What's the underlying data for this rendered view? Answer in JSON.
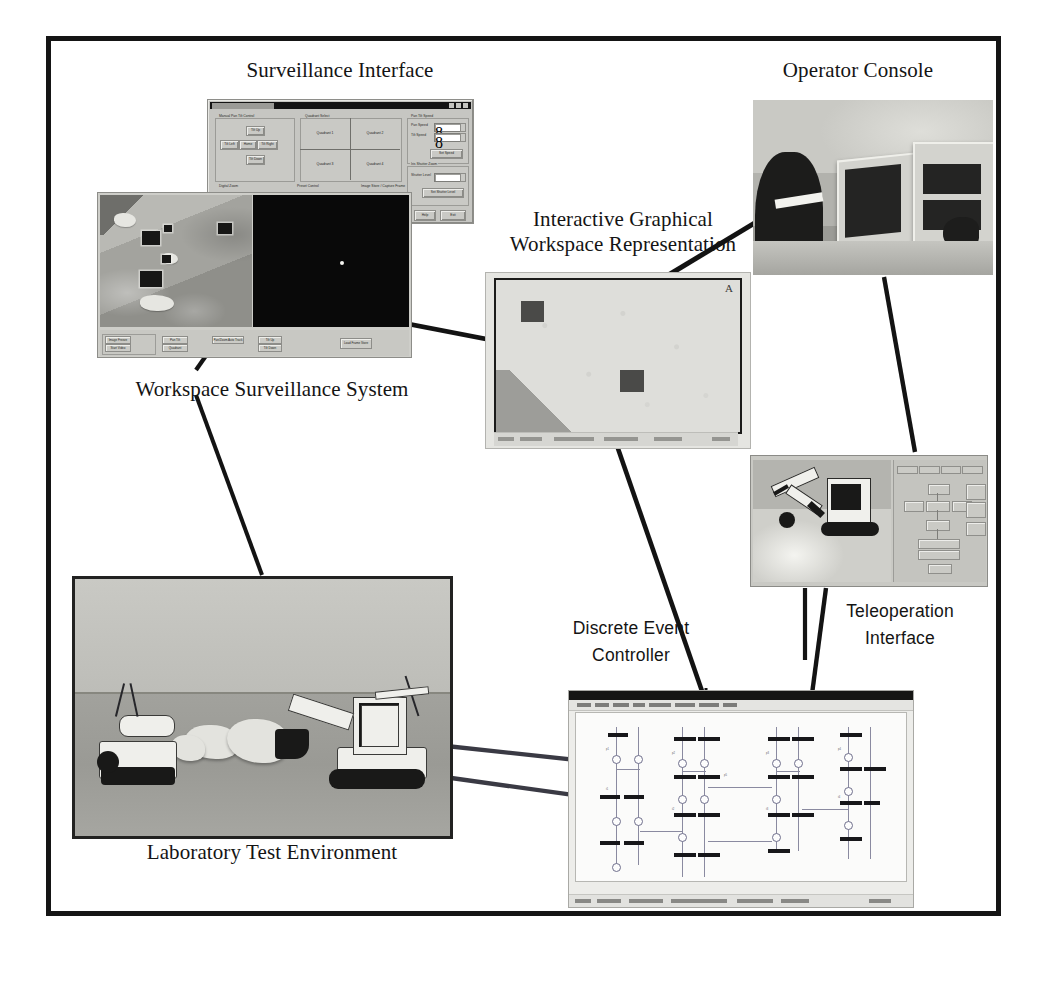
{
  "figure": {
    "frame_color": "#151515",
    "background_color": "#ffffff"
  },
  "labels": [
    {
      "id": "surveillance-interface",
      "text": "Surveillance Interface",
      "style": "serif"
    },
    {
      "id": "operator-console",
      "text": "Operator Console",
      "style": "serif"
    },
    {
      "id": "interactive-graphical",
      "text": "Interactive Graphical\nWorkspace Representation",
      "style": "serif"
    },
    {
      "id": "workspace-surveillance",
      "text": "Workspace Surveillance System",
      "style": "serif"
    },
    {
      "id": "laboratory-test",
      "text": "Laboratory Test Environment",
      "style": "serif"
    },
    {
      "id": "discrete-event-controller",
      "text": "Discrete Event\nController",
      "style": "sans"
    },
    {
      "id": "teleoperation-interface",
      "text": "Teleoperation\nInterface",
      "style": "sans"
    }
  ],
  "panels": {
    "surveillance_dialog": {
      "name": "Surveillance Interface dialog",
      "title_bar_text": "Visual System Control",
      "groups": [
        {
          "label": "Manual Pan Tilt Control"
        },
        {
          "label": "Quadrant Select"
        },
        {
          "label": "Pan Tilt Speed"
        },
        {
          "label": "Iris Shutter Zoom"
        },
        {
          "label": "Digital Zoom"
        },
        {
          "label": "Preset Control"
        },
        {
          "label": "Image Store / Capture Frame"
        }
      ],
      "pan_tilt_buttons": [
        "Tilt Up",
        "Tilt Left",
        "Home",
        "Tilt Right",
        "Tilt Down"
      ],
      "quadrants": [
        "Quadrant 1",
        "Quadrant 2",
        "Quadrant 3",
        "Quadrant 4"
      ],
      "speed_fields": [
        {
          "label": "Pan Speed",
          "value": "8"
        },
        {
          "label": "Tilt Speed",
          "value": "8"
        }
      ],
      "set_speed_button": "Set Speed",
      "shutter_field": {
        "label": "Shutter Level",
        "value": ""
      },
      "set_shutter_button": "Set Shutter Level",
      "footer_buttons": [
        "Help",
        "Exit"
      ],
      "zoom_label": "Zoom",
      "zoom_value": "1.0"
    },
    "workspace_surveillance": {
      "name": "Workspace Surveillance System window",
      "left_view_caption": "Overhead camera view",
      "right_view_caption": "Tracking view",
      "toolbar_group_label": "Camera",
      "toolbar_buttons": [
        "Image Freeze",
        "Start Video",
        "Pan Tilt",
        "Quadrant",
        "Pan/Zoom Auto Track",
        "Tilt Up",
        "Tilt Down",
        "Load Frame Store"
      ]
    },
    "graphical_workspace": {
      "name": "Interactive Graphical Workspace Representation",
      "region_tag": "A",
      "obstacles": 2,
      "status_items": [
        "Ready",
        "Objects: 2",
        "Scale 1:1",
        "Workspace A"
      ]
    },
    "operator_console": {
      "name": "Operator Console photograph",
      "monitor_count": 2,
      "caption": "Operator wearing stereo glasses at dual-monitor console"
    },
    "teleoperation": {
      "name": "Teleoperation Interface window",
      "tabs": [
        "Manual",
        "Auto",
        "Trace",
        "Tools"
      ],
      "control_buttons": [
        "Up",
        "Left",
        "Stop",
        "Right",
        "Down",
        "Grip Open",
        "Grip Close",
        "Zoom In",
        "Zoom Out",
        "Save Position",
        "Move To Position",
        "Exit"
      ],
      "video_caption": "Excavator and manipulator arm video feed"
    },
    "laboratory": {
      "name": "Laboratory Test Environment photograph",
      "machines": [
        "Mobile robot with sensor mast",
        "Tracked excavator"
      ],
      "caption": "Two robotic machines in sand test bed with rock pile"
    },
    "discrete_event_controller": {
      "name": "Discrete Event Controller window",
      "title_bar_text": "Petri Net Editor - system_model.pnt",
      "menu_items": [
        "File",
        "Edit",
        "View",
        "Net",
        "Simulate",
        "Analyze",
        "Window",
        "Help"
      ],
      "status_items": [
        "Ready",
        "Places: 48",
        "Transitions: 36",
        "Marking: valid",
        "100%"
      ],
      "node_labels": [
        "p1",
        "t1",
        "p2",
        "t2",
        "p3",
        "t3",
        "p4",
        "t4",
        "p5",
        "t5",
        "p6",
        "t6"
      ]
    }
  },
  "connectors": [
    {
      "from": "workspace-surveillance-label",
      "to": "workspace-surveillance-panel"
    },
    {
      "from": "workspace-surveillance-panel",
      "to": "graphical-workspace-panel"
    },
    {
      "from": "graphical-workspace-label",
      "to": "operator-console-panel"
    },
    {
      "from": "graphical-workspace-panel",
      "to": "discrete-event-controller-panel"
    },
    {
      "from": "operator-console-panel",
      "to": "teleoperation-panel"
    },
    {
      "from": "teleoperation-panel",
      "to": "discrete-event-controller-panel"
    },
    {
      "from": "laboratory-panel",
      "to": "discrete-event-controller-panel"
    },
    {
      "from": "surveillance-dialog",
      "to": "workspace-surveillance-panel"
    }
  ]
}
